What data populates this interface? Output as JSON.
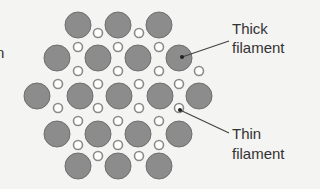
{
  "labels": {
    "thick_line1": "Thick",
    "thick_line2": "filament",
    "thin_line1": "Thin",
    "thin_line2": "filament",
    "cropped_left": "n"
  },
  "colors": {
    "background": "#f4f4f2",
    "thick_fill": "#8c8c8c",
    "thick_stroke": "#6e6e6e",
    "thin_fill": "#ffffff",
    "thin_stroke": "#8a8a8a",
    "leader": "#444444"
  },
  "thick_filaments": [
    [
      78,
      25
    ],
    [
      118,
      25
    ],
    [
      159,
      25
    ],
    [
      57,
      58
    ],
    [
      98,
      58
    ],
    [
      138,
      58
    ],
    [
      179,
      58
    ],
    [
      37,
      96
    ],
    [
      80,
      96
    ],
    [
      119,
      96
    ],
    [
      160,
      96
    ],
    [
      199,
      96
    ],
    [
      57,
      134
    ],
    [
      98,
      134
    ],
    [
      138,
      134
    ],
    [
      179,
      134
    ],
    [
      78,
      166
    ],
    [
      118,
      166
    ],
    [
      159,
      166
    ]
  ],
  "thin_filaments": [
    [
      98,
      33
    ],
    [
      139,
      33
    ],
    [
      78,
      47
    ],
    [
      118,
      47
    ],
    [
      159,
      47
    ],
    [
      78,
      71
    ],
    [
      118,
      71
    ],
    [
      159,
      71
    ],
    [
      199,
      71
    ],
    [
      58,
      84
    ],
    [
      98,
      84
    ],
    [
      139,
      84
    ],
    [
      179,
      84
    ],
    [
      58,
      108
    ],
    [
      98,
      108
    ],
    [
      139,
      108
    ],
    [
      179,
      108
    ],
    [
      78,
      121
    ],
    [
      118,
      121
    ],
    [
      159,
      121
    ],
    [
      78,
      145
    ],
    [
      118,
      145
    ],
    [
      159,
      145
    ],
    [
      98,
      156
    ],
    [
      139,
      156
    ]
  ],
  "leaders": {
    "thick": {
      "from": [
        182,
        57
      ],
      "to": [
        229,
        41
      ]
    },
    "thin": {
      "from": [
        180,
        110
      ],
      "to": [
        229,
        133
      ]
    }
  }
}
